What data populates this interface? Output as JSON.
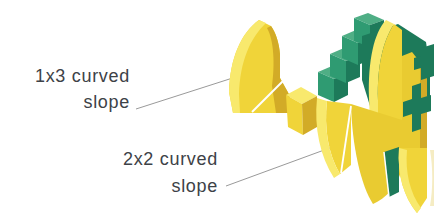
{
  "canvas": {
    "width": 434,
    "height": 223,
    "background": "#ffffff"
  },
  "annotations": {
    "slope_1x3": {
      "line1": "1x3 curved",
      "line2": "slope"
    },
    "slope_2x2": {
      "line1": "2x2 curved",
      "line2": "slope"
    }
  },
  "illustration": {
    "pieces": [
      {
        "id": "curved-slope-1x3",
        "description": "yellow 1x3 curved slope brick"
      },
      {
        "id": "small-brick",
        "description": "small yellow brick"
      },
      {
        "id": "slope-assembly",
        "description": "yellow and green assembly of curved slopes and bricks"
      }
    ]
  },
  "colors": {
    "label_text": "#3d4247",
    "leader_line": "#9a9a9a",
    "yellow_light": "#f8e96d",
    "yellow_mid": "#f0d439",
    "yellow_mid2": "#e9cb31",
    "yellow_dark": "#d2ab27",
    "yellow_pale": "#f5ecc3",
    "green_light": "#4fae85",
    "green_mid": "#2f9b72",
    "green_dark": "#1d7a5a",
    "white_gap": "#ffffff"
  }
}
